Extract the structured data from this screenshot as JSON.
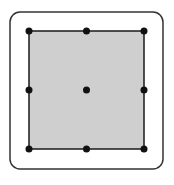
{
  "diagram": {
    "frame": {
      "x": 10,
      "y": 12,
      "width": 153,
      "height": 157,
      "radius": 10,
      "stroke": "#333333",
      "stroke_width": 1.5
    },
    "square": {
      "x": 29,
      "y": 31,
      "width": 115,
      "height": 118,
      "fill": "#cfcfcf",
      "stroke": "#1a1a1a",
      "stroke_width": 1.5
    },
    "handle_radius": 3.5,
    "handle_color": "#111111",
    "handles": [
      {
        "name": "top-left",
        "x": 29,
        "y": 31
      },
      {
        "name": "top-center",
        "x": 86.5,
        "y": 31
      },
      {
        "name": "top-right",
        "x": 144,
        "y": 31
      },
      {
        "name": "middle-left",
        "x": 29,
        "y": 90
      },
      {
        "name": "center",
        "x": 86.5,
        "y": 90
      },
      {
        "name": "middle-right",
        "x": 144,
        "y": 90
      },
      {
        "name": "bottom-left",
        "x": 29,
        "y": 149
      },
      {
        "name": "bottom-center",
        "x": 86.5,
        "y": 149
      },
      {
        "name": "bottom-right",
        "x": 144,
        "y": 149
      }
    ]
  }
}
